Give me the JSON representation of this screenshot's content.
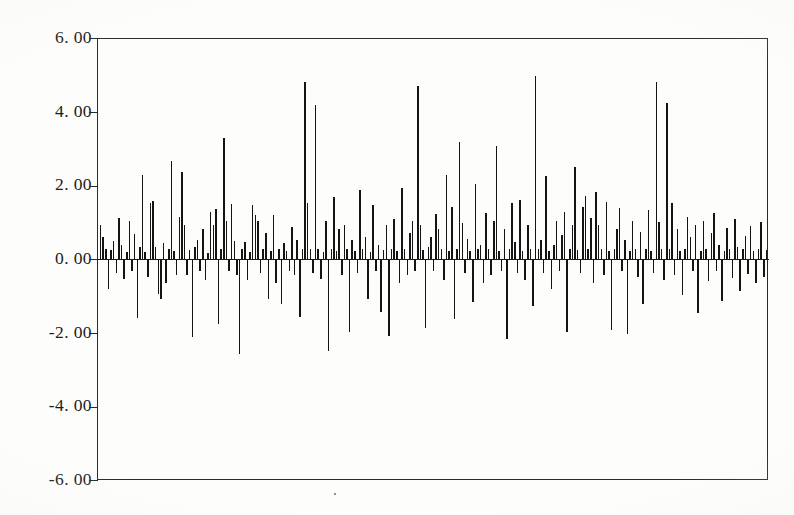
{
  "figure": {
    "background_color": "#fdfdfc",
    "ink_color": "#141414",
    "axis_color": "#2a2a2a"
  },
  "axis": {
    "y_tick_labels": [
      "6. 00",
      "4. 00",
      "2. 00",
      "0. 00",
      "-2. 00",
      "-4. 00",
      "-6. 00"
    ],
    "x_tick_labels": []
  },
  "chart_data": {
    "type": "bar",
    "title": "",
    "subtitle": "",
    "xlabel": "",
    "ylabel": "",
    "ylim": [
      -6.0,
      6.0
    ],
    "yticks": [
      6.0,
      4.0,
      2.0,
      0.0,
      -2.0,
      -4.0,
      -6.0
    ],
    "ytick_labels": [
      "6. 00",
      "4. 00",
      "2. 00",
      "0. 00",
      "-2. 00",
      "-4. 00",
      "-6. 00"
    ],
    "xlim": [
      0,
      255
    ],
    "xticks": [],
    "xtick_labels": [],
    "grid": false,
    "legend": null,
    "baseline": 0.0,
    "annotations": [],
    "series_name": "residuals",
    "n_points": 255,
    "values": [
      0.95,
      0.62,
      0.3,
      -0.78,
      0.28,
      0.52,
      -0.35,
      1.15,
      0.4,
      -0.52,
      0.22,
      1.05,
      -0.3,
      0.7,
      -1.58,
      0.35,
      2.32,
      0.22,
      -0.45,
      1.55,
      1.6,
      0.35,
      -0.92,
      -1.05,
      0.45,
      -0.62,
      0.3,
      2.7,
      0.25,
      -0.42,
      1.18,
      2.38,
      0.95,
      -0.4,
      0.28,
      -2.1,
      0.35,
      0.55,
      -0.3,
      0.85,
      -0.55,
      0.2,
      1.3,
      0.95,
      1.38,
      -1.75,
      0.3,
      3.3,
      1.05,
      -0.3,
      1.52,
      0.52,
      -0.4,
      -2.55,
      0.3,
      0.48,
      -0.55,
      0.22,
      1.48,
      1.22,
      1.05,
      -0.35,
      0.3,
      0.72,
      -1.05,
      0.25,
      1.22,
      -0.62,
      0.3,
      -1.2,
      0.45,
      0.25,
      -0.3,
      0.9,
      -0.4,
      0.55,
      -1.55,
      0.3,
      4.82,
      1.55,
      0.3,
      -0.35,
      4.2,
      0.3,
      -0.52,
      0.22,
      1.05,
      -2.48,
      0.3,
      1.7,
      0.25,
      0.85,
      -0.4,
      0.95,
      0.3,
      -1.95,
      0.55,
      0.25,
      -0.35,
      1.9,
      0.3,
      0.62,
      -1.05,
      0.22,
      1.5,
      -0.3,
      0.4,
      -1.42,
      0.28,
      0.95,
      -2.05,
      0.3,
      1.12,
      0.25,
      -0.62,
      1.95,
      0.3,
      -0.4,
      0.72,
      1.05,
      -0.3,
      4.72,
      0.95,
      0.28,
      -1.85,
      0.35,
      0.62,
      -0.3,
      1.25,
      0.85,
      0.3,
      -0.55,
      2.3,
      0.25,
      1.45,
      -1.6,
      0.3,
      3.2,
      1.0,
      -0.35,
      0.58,
      0.25,
      -1.15,
      2.05,
      0.3,
      0.42,
      -0.62,
      1.28,
      0.3,
      -0.4,
      1.05,
      3.1,
      0.25,
      -0.3,
      0.85,
      -2.15,
      0.3,
      1.55,
      0.48,
      -0.35,
      1.62,
      0.25,
      -0.55,
      0.95,
      0.3,
      -1.25,
      5.0,
      0.3,
      0.55,
      -0.35,
      2.28,
      0.25,
      -0.8,
      0.4,
      1.05,
      -0.3,
      0.68,
      1.3,
      -1.95,
      0.3,
      0.95,
      2.52,
      0.28,
      -0.35,
      1.45,
      1.75,
      0.3,
      1.15,
      -0.62,
      1.85,
      0.95,
      0.3,
      -0.4,
      1.58,
      0.25,
      -1.9,
      0.3,
      0.85,
      1.42,
      -0.3,
      0.55,
      -2.0,
      0.25,
      1.05,
      0.3,
      -0.45,
      0.75,
      -1.2,
      0.3,
      1.35,
      0.25,
      -0.35,
      4.82,
      1.02,
      0.3,
      -0.55,
      4.25,
      0.3,
      1.55,
      -0.4,
      0.85,
      0.25,
      -0.95,
      0.3,
      1.18,
      0.62,
      -0.3,
      0.95,
      -1.45,
      0.25,
      1.05,
      0.3,
      -0.58,
      0.72,
      1.28,
      -0.3,
      0.42,
      -1.1,
      0.25,
      0.88,
      0.3,
      -0.48,
      1.12,
      0.35,
      -0.85,
      0.3,
      0.65,
      -0.38,
      0.92,
      0.25,
      -0.62,
      0.3,
      1.02,
      -0.45,
      0.28
    ]
  }
}
